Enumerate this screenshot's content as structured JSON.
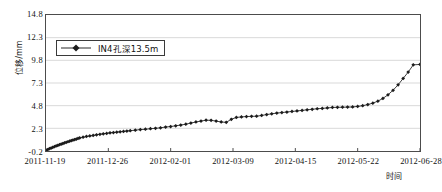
{
  "chart_data": {
    "type": "line",
    "title": "",
    "xlabel": "时间",
    "ylabel": "位移/mm",
    "legend": [
      "IN4孔深13.5m"
    ],
    "legend_position": "upper-left-inside",
    "grid": true,
    "grid_axis": "y",
    "ylim": [
      -0.2,
      14.8
    ],
    "ytick_labels": [
      "14.8",
      "12.3",
      "9.8",
      "7.3",
      "4.8",
      "2.3",
      "-0.2"
    ],
    "ytick_values": [
      14.8,
      12.3,
      9.8,
      7.3,
      4.8,
      2.3,
      -0.2
    ],
    "xtick_labels": [
      "2011-11-19",
      "2011-12-26",
      "2012-02-01",
      "2012-03-09",
      "2012-04-15",
      "2012-05-22",
      "2012-06-28"
    ],
    "xtick_values": [
      0,
      37,
      74,
      111,
      148,
      185,
      222
    ],
    "xlim": [
      0,
      222
    ],
    "marker": "diamond",
    "line_color": "#2b2b2b",
    "marker_color": "#1c1c1c",
    "axis_color": "#4c4c4c",
    "grid_color": "#d9d9d9",
    "background": "#ffffff",
    "series": [
      {
        "name": "IN4孔深13.5m",
        "x": [
          0,
          1,
          2,
          3,
          4,
          5,
          6,
          7,
          8,
          9,
          10,
          11,
          12,
          13,
          14,
          15,
          16,
          17,
          18,
          19,
          20,
          22,
          24,
          26,
          28,
          30,
          32,
          34,
          36,
          38,
          40,
          42,
          44,
          46,
          48,
          50,
          53,
          56,
          59,
          62,
          65,
          68,
          71,
          74,
          77,
          80,
          83,
          86,
          89,
          92,
          95,
          98,
          101,
          104,
          107,
          110,
          113,
          116,
          119,
          122,
          125,
          128,
          131,
          134,
          137,
          140,
          143,
          146,
          149,
          152,
          155,
          158,
          161,
          164,
          167,
          170,
          173,
          176,
          179,
          182,
          185,
          188,
          191,
          194,
          197,
          200,
          203,
          206,
          209,
          212,
          215,
          218,
          222
        ],
        "y": [
          -0.15,
          -0.05,
          0.05,
          0.12,
          0.2,
          0.28,
          0.36,
          0.42,
          0.5,
          0.56,
          0.62,
          0.7,
          0.76,
          0.82,
          0.88,
          0.95,
          1.0,
          1.06,
          1.12,
          1.18,
          1.24,
          1.32,
          1.4,
          1.46,
          1.52,
          1.58,
          1.64,
          1.7,
          1.74,
          1.8,
          1.84,
          1.88,
          1.92,
          1.96,
          2.0,
          2.04,
          2.1,
          2.16,
          2.2,
          2.26,
          2.3,
          2.36,
          2.44,
          2.5,
          2.58,
          2.66,
          2.76,
          2.88,
          3.0,
          3.1,
          3.2,
          3.18,
          3.1,
          3.0,
          2.96,
          3.3,
          3.5,
          3.56,
          3.6,
          3.62,
          3.64,
          3.72,
          3.82,
          3.9,
          3.98,
          4.04,
          4.1,
          4.16,
          4.22,
          4.28,
          4.34,
          4.4,
          4.46,
          4.5,
          4.55,
          4.6,
          4.62,
          4.63,
          4.64,
          4.66,
          4.72,
          4.8,
          4.92,
          5.08,
          5.3,
          5.6,
          6.0,
          6.5,
          7.1,
          7.8,
          8.5,
          9.3,
          9.35
        ]
      }
    ]
  }
}
